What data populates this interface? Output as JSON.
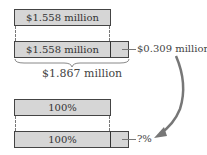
{
  "top": {
    "bar1_label": "$1.558 million",
    "bar2_label": "$1.558 million",
    "extension_label": "$0.309 million",
    "total_label": "$1.867 million"
  },
  "bottom": {
    "bar1_label": "100%",
    "bar2_label": "100%",
    "extension_label": "?%"
  },
  "colors": {
    "bar_fill": "#d6d6d6",
    "arrow": "#777777"
  }
}
